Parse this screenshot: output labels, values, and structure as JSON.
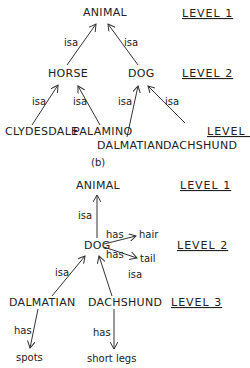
{
  "diagram_a": {
    "nodes": {
      "animal": "ANIMAL",
      "horse": "HORSE",
      "dog": "DOG",
      "clydesdale": "CLYDESDALE",
      "palamino": "PALAMINO",
      "dalmatian": "DALMATIAN",
      "dachshund": "DACHSHUND"
    },
    "edge_label": "isa",
    "levels": [
      "LEVEL 1",
      "LEVEL 2",
      "LEVEL 3"
    ]
  },
  "caption": "(b)",
  "diagram_b": {
    "nodes": {
      "animal": "ANIMAL",
      "dog": "DOG",
      "hair": "hair",
      "tail": "tail",
      "dalmatian": "DALMATIAN",
      "dachshund": "DACHSHUND",
      "spots": "spots",
      "shortlegs": "short legs"
    },
    "edge_isa": "isa",
    "edge_has": "has",
    "levels": [
      "LEVEL 1",
      "LEVEL 2",
      "LEVEL 3"
    ]
  }
}
